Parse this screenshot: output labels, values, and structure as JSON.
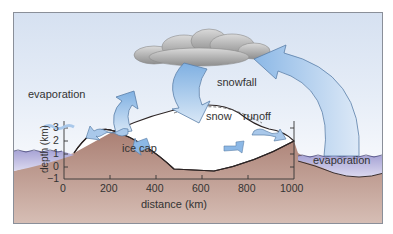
{
  "diagram": {
    "labels": {
      "snowfall": "snowfall",
      "evaporation_left": "evaporation",
      "evaporation_right": "evaporation",
      "snow": "snow",
      "runoff": "runoff",
      "ice_cap": "ice cap"
    },
    "axes": {
      "x_label": "distance (km)",
      "y_label": "depth (km)",
      "x_ticks": [
        "0",
        "200",
        "400",
        "600",
        "800",
        "1000"
      ],
      "y_ticks": [
        "3",
        "2",
        "1",
        "0",
        "−1"
      ]
    },
    "colors": {
      "sky_top": "#d6e1f1",
      "arrow_fill": "#a9c8ea",
      "cloud": "#a8a8a8",
      "rock": "#b48a7e",
      "water": "#b9b6dc",
      "ice": "#ffffff"
    }
  }
}
